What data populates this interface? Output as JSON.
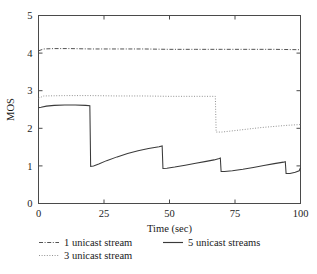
{
  "chart_data": {
    "type": "line",
    "title": "",
    "xlabel": "Time (sec)",
    "ylabel": "MOS",
    "xlim": [
      0,
      100
    ],
    "ylim": [
      0,
      5
    ],
    "xticks": [
      0,
      25,
      50,
      75,
      100
    ],
    "yticks": [
      0,
      1,
      2,
      3,
      4,
      5
    ],
    "xtick_labels": [
      "0",
      "25",
      "50",
      "75",
      "100"
    ],
    "ytick_labels": [
      "0",
      "1",
      "2",
      "3",
      "4",
      "5"
    ],
    "grid": false,
    "legend_position": "below",
    "series": [
      {
        "name": "1 unicast stream",
        "style": "dash-dot",
        "color": "#4a4a4a",
        "points": [
          [
            0,
            4.06
          ],
          [
            2,
            4.11
          ],
          [
            6,
            4.12
          ],
          [
            12,
            4.12
          ],
          [
            20,
            4.11
          ],
          [
            30,
            4.11
          ],
          [
            40,
            4.11
          ],
          [
            50,
            4.1
          ],
          [
            60,
            4.1
          ],
          [
            70,
            4.1
          ],
          [
            80,
            4.1
          ],
          [
            90,
            4.1
          ],
          [
            100,
            4.09
          ]
        ]
      },
      {
        "name": "3 unicast stream",
        "style": "dotted",
        "color": "#8c8c8c",
        "points": [
          [
            0,
            2.8
          ],
          [
            2,
            2.86
          ],
          [
            10,
            2.87
          ],
          [
            20,
            2.87
          ],
          [
            30,
            2.86
          ],
          [
            40,
            2.86
          ],
          [
            50,
            2.85
          ],
          [
            60,
            2.85
          ],
          [
            67.5,
            2.85
          ],
          [
            67.8,
            1.9
          ],
          [
            70,
            1.9
          ],
          [
            75,
            1.94
          ],
          [
            80,
            1.98
          ],
          [
            85,
            2.02
          ],
          [
            90,
            2.05
          ],
          [
            95,
            2.08
          ],
          [
            100,
            2.1
          ]
        ]
      },
      {
        "name": "5 unicast streams",
        "style": "solid",
        "color": "#3a3a3a",
        "points": [
          [
            0,
            2.55
          ],
          [
            1,
            2.56
          ],
          [
            3,
            2.59
          ],
          [
            6,
            2.61
          ],
          [
            10,
            2.62
          ],
          [
            14,
            2.62
          ],
          [
            18,
            2.61
          ],
          [
            19.6,
            2.6
          ],
          [
            19.9,
            0.99
          ],
          [
            21,
            1.0
          ],
          [
            23,
            1.05
          ],
          [
            26,
            1.14
          ],
          [
            30,
            1.24
          ],
          [
            34,
            1.33
          ],
          [
            38,
            1.4
          ],
          [
            42,
            1.46
          ],
          [
            46,
            1.51
          ],
          [
            47.2,
            1.53
          ],
          [
            47.5,
            0.93
          ],
          [
            49,
            0.94
          ],
          [
            52,
            0.97
          ],
          [
            56,
            1.02
          ],
          [
            60,
            1.07
          ],
          [
            64,
            1.12
          ],
          [
            67,
            1.16
          ],
          [
            69,
            1.2
          ],
          [
            69.4,
            1.21
          ],
          [
            69.7,
            0.85
          ],
          [
            71,
            0.85
          ],
          [
            74,
            0.87
          ],
          [
            78,
            0.91
          ],
          [
            82,
            0.96
          ],
          [
            86,
            1.01
          ],
          [
            90,
            1.06
          ],
          [
            93.5,
            1.1
          ],
          [
            94.2,
            1.11
          ],
          [
            94.5,
            0.8
          ],
          [
            96,
            0.8
          ],
          [
            98,
            0.83
          ],
          [
            99.5,
            0.87
          ],
          [
            100,
            0.95
          ]
        ]
      }
    ],
    "legend": [
      {
        "label": "1 unicast stream",
        "style": "dash-dot",
        "color": "#4a4a4a"
      },
      {
        "label": "3 unicast stream",
        "style": "dotted",
        "color": "#8c8c8c"
      },
      {
        "label": "5 unicast streams",
        "style": "solid",
        "color": "#3a3a3a"
      }
    ]
  }
}
